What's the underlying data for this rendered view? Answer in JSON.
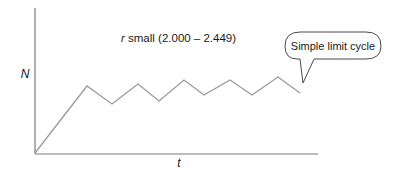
{
  "title": {
    "prefix": "r",
    "text": " small (2.000 – 2.449)"
  },
  "axes": {
    "y_label": "N",
    "x_label": "t",
    "color": "#7a7a7a"
  },
  "callout": {
    "text": "Simple limit cycle",
    "border_color": "#4a4a4a"
  },
  "chart_data": {
    "type": "line",
    "title": "r small (2.000 – 2.449)",
    "xlabel": "t",
    "ylabel": "N",
    "grid": false,
    "annotations": [
      "Simple limit cycle"
    ],
    "series": [
      {
        "name": "N(t)",
        "color": "#9a9a9a",
        "points_px": [
          [
            35,
            153
          ],
          [
            87,
            86
          ],
          [
            112,
            104
          ],
          [
            138,
            84
          ],
          [
            159,
            101
          ],
          [
            184,
            80
          ],
          [
            204,
            95
          ],
          [
            230,
            80
          ],
          [
            252,
            95
          ],
          [
            278,
            77
          ],
          [
            300,
            93
          ]
        ]
      }
    ]
  }
}
